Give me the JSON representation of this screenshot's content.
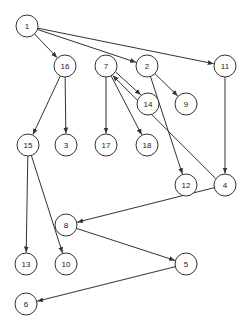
{
  "diagram": {
    "type": "directed-graph",
    "node_radius": 11,
    "colors": {
      "stroke": "#333333",
      "fill": "#ffffff",
      "text": "#222222"
    },
    "nodes": [
      {
        "id": "1",
        "label": "1",
        "x": 27,
        "y": 26
      },
      {
        "id": "16",
        "label": "16",
        "x": 65,
        "y": 66
      },
      {
        "id": "7",
        "label": "7",
        "x": 106,
        "y": 66
      },
      {
        "id": "2",
        "label": "2",
        "x": 147,
        "y": 66
      },
      {
        "id": "11",
        "label": "11",
        "x": 225,
        "y": 66
      },
      {
        "id": "14",
        "label": "14",
        "x": 148,
        "y": 104
      },
      {
        "id": "9",
        "label": "9",
        "x": 186,
        "y": 104
      },
      {
        "id": "15",
        "label": "15",
        "x": 28,
        "y": 145
      },
      {
        "id": "3",
        "label": "3",
        "x": 66,
        "y": 145
      },
      {
        "id": "17",
        "label": "17",
        "x": 106,
        "y": 145
      },
      {
        "id": "18",
        "label": "18",
        "x": 147,
        "y": 145
      },
      {
        "id": "12",
        "label": "12",
        "x": 186,
        "y": 185
      },
      {
        "id": "4",
        "label": "4",
        "x": 225,
        "y": 185
      },
      {
        "id": "8",
        "label": "8",
        "x": 66,
        "y": 225
      },
      {
        "id": "13",
        "label": "13",
        "x": 26,
        "y": 264
      },
      {
        "id": "10",
        "label": "10",
        "x": 66,
        "y": 264
      },
      {
        "id": "5",
        "label": "5",
        "x": 186,
        "y": 264
      },
      {
        "id": "6",
        "label": "6",
        "x": 26,
        "y": 304
      }
    ],
    "edges": [
      {
        "from": "1",
        "to": "16"
      },
      {
        "from": "1",
        "to": "2"
      },
      {
        "from": "1",
        "to": "11"
      },
      {
        "from": "16",
        "to": "15"
      },
      {
        "from": "16",
        "to": "3"
      },
      {
        "from": "7",
        "to": "14",
        "offset": -2
      },
      {
        "from": "4",
        "to": "7",
        "offset": -2
      },
      {
        "from": "7",
        "to": "17"
      },
      {
        "from": "7",
        "to": "18"
      },
      {
        "from": "2",
        "to": "9"
      },
      {
        "from": "2",
        "to": "12"
      },
      {
        "from": "11",
        "to": "4"
      },
      {
        "from": "4",
        "to": "8"
      },
      {
        "from": "15",
        "to": "13"
      },
      {
        "from": "15",
        "to": "10"
      },
      {
        "from": "8",
        "to": "5"
      },
      {
        "from": "5",
        "to": "6"
      }
    ]
  }
}
